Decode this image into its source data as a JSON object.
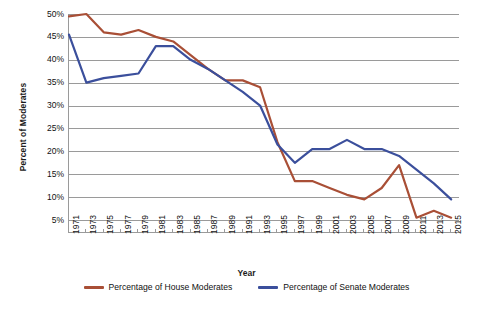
{
  "chart_data": {
    "type": "line",
    "title": "",
    "xlabel": "Year",
    "ylabel": "Percent of Moderates",
    "grid": true,
    "legend_position": "bottom",
    "xlim": [
      1971,
      2015
    ],
    "ylim": [
      0,
      50
    ],
    "ytick_labels": [
      "50%",
      "45%",
      "40%",
      "35%",
      "30%",
      "25%",
      "20%",
      "15%",
      "10%",
      "5%"
    ],
    "ytick_values": [
      50,
      45,
      40,
      35,
      30,
      25,
      20,
      15,
      10,
      5
    ],
    "x": [
      1971,
      1973,
      1975,
      1977,
      1979,
      1981,
      1983,
      1985,
      1987,
      1989,
      1991,
      1993,
      1995,
      1997,
      1999,
      2001,
      2003,
      2005,
      2007,
      2009,
      2011,
      2013,
      2015
    ],
    "xtick_labels": [
      "1971",
      "1973",
      "1975",
      "1977",
      "1979",
      "1981",
      "1983",
      "1985",
      "1987",
      "1989",
      "1991",
      "1993",
      "1995",
      "1997",
      "1999",
      "2001",
      "2003",
      "2005",
      "2007",
      "2009",
      "2011",
      "2013",
      "2015"
    ],
    "series": [
      {
        "name": "Percentage of House Moderates",
        "color": "#a94f36",
        "values": [
          49.5,
          50.0,
          46.0,
          45.5,
          46.5,
          45.0,
          44.0,
          41.0,
          38.0,
          35.5,
          35.5,
          34.0,
          22.0,
          13.5,
          13.5,
          12.0,
          10.5,
          9.5,
          12.0,
          17.0,
          5.5,
          7.0,
          5.5
        ]
      },
      {
        "name": "Percentage of Senate Moderates",
        "color": "#3b4f9c",
        "values": [
          45.5,
          35.0,
          36.0,
          36.5,
          37.0,
          43.0,
          43.0,
          40.0,
          38.0,
          35.5,
          33.0,
          30.0,
          21.5,
          17.5,
          20.5,
          20.5,
          22.5,
          20.5,
          20.5,
          19.0,
          16.0,
          13.0,
          9.5
        ]
      }
    ]
  },
  "legend": {
    "items": [
      {
        "label": "Percentage of House Moderates",
        "color": "#a94f36"
      },
      {
        "label": "Percentage of Senate Moderates",
        "color": "#3b4f9c"
      }
    ]
  }
}
